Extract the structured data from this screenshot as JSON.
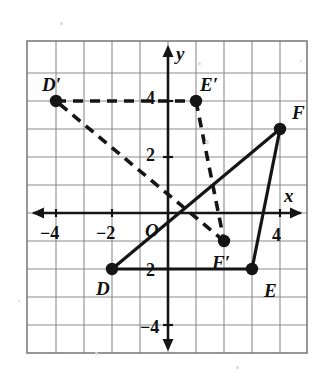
{
  "figure": {
    "kind": "coordinate-grid-triangle-transformation",
    "background": "#ffffff",
    "ink_color": "#151515",
    "grid_color": "#8c8c8c"
  },
  "chart_data": {
    "type": "scatter",
    "title": "",
    "xlabel": "x",
    "ylabel": "y",
    "xlim": [
      -5,
      5
    ],
    "ylim": [
      -5.5,
      5.5
    ],
    "grid": true,
    "grid_step": 1,
    "legend": "none",
    "axis_labels": {
      "x": "x",
      "y": "y",
      "origin": "O"
    },
    "x_ticks": [
      {
        "value": -4,
        "label": "−4"
      },
      {
        "value": -2,
        "label": "−2"
      },
      {
        "value": 4,
        "label": "4"
      }
    ],
    "y_ticks": [
      {
        "value": 4,
        "label": "4"
      },
      {
        "value": 2,
        "label": "2"
      },
      {
        "value": -2,
        "label": "2"
      },
      {
        "value": -4,
        "label": "−4"
      }
    ],
    "series": [
      {
        "name": "Triangle DEF",
        "style": "solid",
        "points": [
          {
            "label": "D",
            "x": -2,
            "y": -2,
            "label_dx": -16,
            "label_dy": 20
          },
          {
            "label": "E",
            "x": 3,
            "y": -2,
            "label_dx": 12,
            "label_dy": 22
          },
          {
            "label": "F",
            "x": 4,
            "y": 3,
            "label_dx": 12,
            "label_dy": -16
          }
        ],
        "edges": [
          [
            0,
            1
          ],
          [
            1,
            2
          ],
          [
            2,
            0
          ]
        ]
      },
      {
        "name": "Triangle D'E'F'",
        "style": "dashed",
        "points": [
          {
            "label": "D′",
            "x": -4,
            "y": 4,
            "label_dx": -14,
            "label_dy": -16
          },
          {
            "label": "E′",
            "x": 1,
            "y": 4,
            "label_dx": 4,
            "label_dy": -16
          },
          {
            "label": "F′",
            "x": 2,
            "y": -1,
            "label_dx": -12,
            "label_dy": 22
          }
        ],
        "edges": [
          [
            0,
            1
          ],
          [
            1,
            2
          ],
          [
            2,
            0
          ]
        ]
      }
    ]
  }
}
